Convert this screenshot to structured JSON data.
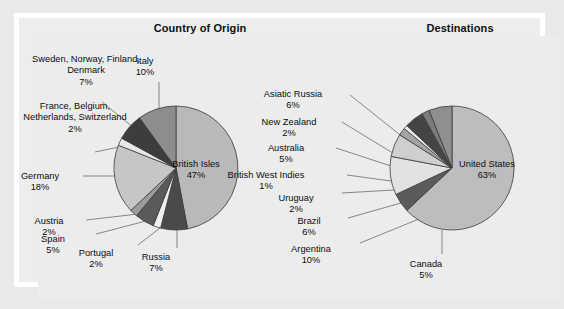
{
  "figure": {
    "background": "#ececec",
    "frame_color": "#ffffff",
    "outer_color": "#e9e9e9"
  },
  "charts": [
    {
      "id": "country-of-origin",
      "title": "Country of Origin",
      "type": "pie",
      "center": [
        176,
        168
      ],
      "radius": 62,
      "start_angle_deg": -90,
      "direction": "clockwise",
      "slices": [
        {
          "label": "British Isles",
          "value": 47,
          "pct_text": "47%",
          "color": "#b9b9b9",
          "label_mode": "inside",
          "label_x": 196,
          "label_y": 159
        },
        {
          "label": "Russia",
          "value": 7,
          "pct_text": "7%",
          "color": "#4a4a4a",
          "label_mode": "outside",
          "label_x": 156,
          "label_y": 252,
          "align": "center",
          "leader": [
            [
              177,
              230
            ],
            [
              177,
              248
            ]
          ]
        },
        {
          "label": "Portugal",
          "value": 2,
          "pct_text": "2%",
          "color": "#f0f0f0",
          "label_mode": "outside",
          "label_x": 96,
          "label_y": 248,
          "align": "center",
          "leader": [
            [
              160,
              228
            ],
            [
              138,
              245
            ]
          ]
        },
        {
          "label": "Spain",
          "value": 5,
          "pct_text": "5%",
          "color": "#5a5a5a",
          "label_mode": "outside",
          "label_x": 53,
          "label_y": 234,
          "align": "center",
          "leader": [
            [
              146,
              221
            ],
            [
              96,
              234
            ]
          ]
        },
        {
          "label": "Austria",
          "value": 2,
          "pct_text": "2%",
          "color": "#9c9c9c",
          "label_mode": "outside",
          "label_x": 49,
          "label_y": 216,
          "align": "center",
          "leader": [
            [
              138,
              214
            ],
            [
              86,
              220
            ]
          ]
        },
        {
          "label": "Germany",
          "value": 18,
          "pct_text": "18%",
          "color": "#c6c6c6",
          "label_mode": "outside",
          "label_x": 40,
          "label_y": 171,
          "align": "center",
          "leader": [
            [
              121,
              176
            ],
            [
              83,
              176
            ]
          ]
        },
        {
          "label": "France, Belgium, Netherlands, Switzerland",
          "value": 2,
          "pct_text": "2%",
          "color": "#e7e7e7",
          "label_mode": "outside",
          "label_x": 20,
          "label_y": 101,
          "align": "center",
          "leader": [
            [
              124,
              146
            ],
            [
              95,
              152
            ]
          ]
        },
        {
          "label": "Sweden, Norway, Finland, Denmark",
          "value": 7,
          "pct_text": "7%",
          "color": "#3d3d3d",
          "label_mode": "outside",
          "label_x": 31,
          "label_y": 54,
          "align": "center",
          "leader": [
            [
              134,
              128
            ],
            [
              102,
              102
            ]
          ]
        },
        {
          "label": "Italy",
          "value": 10,
          "pct_text": "10%",
          "color": "#8d8d8d",
          "label_mode": "outside",
          "label_x": 145,
          "label_y": 56,
          "align": "center",
          "leader": [
            [
              159,
              109
            ],
            [
              159,
              82
            ]
          ]
        }
      ]
    },
    {
      "id": "destinations",
      "title": "Destinations",
      "type": "pie",
      "center": [
        452,
        168
      ],
      "radius": 62,
      "start_angle_deg": -90,
      "direction": "clockwise",
      "slices": [
        {
          "label": "United States",
          "value": 63,
          "pct_text": "63%",
          "color": "#bdbdbd",
          "label_mode": "inside",
          "label_x": 487,
          "label_y": 159
        },
        {
          "label": "Canada",
          "value": 5,
          "pct_text": "5%",
          "color": "#5b5b5b",
          "label_mode": "outside",
          "label_x": 426,
          "label_y": 259,
          "align": "center",
          "leader": [
            [
              442,
              230
            ],
            [
              442,
              254
            ]
          ]
        },
        {
          "label": "Argentina",
          "value": 10,
          "pct_text": "10%",
          "color": "#e2e2e2",
          "label_mode": "outside",
          "label_x": 311,
          "label_y": 244,
          "align": "center",
          "leader": [
            [
              419,
              219
            ],
            [
              360,
              243
            ]
          ]
        },
        {
          "label": "Brazil",
          "value": 6,
          "pct_text": "6%",
          "color": "#cfcfcf",
          "label_mode": "outside",
          "label_x": 309,
          "label_y": 216,
          "align": "center",
          "leader": [
            [
              401,
              203
            ],
            [
              348,
              218
            ]
          ]
        },
        {
          "label": "Uruguay",
          "value": 2,
          "pct_text": "2%",
          "color": "#a5a5a5",
          "label_mode": "outside",
          "label_x": 296,
          "label_y": 193,
          "align": "center",
          "leader": [
            [
              394,
              190
            ],
            [
              342,
              193
            ]
          ]
        },
        {
          "label": "British West Indies",
          "value": 1,
          "pct_text": "1%",
          "color": "#efefef",
          "label_mode": "outside",
          "label_x": 266,
          "label_y": 170,
          "align": "center",
          "leader": [
            [
              391,
              181
            ],
            [
              347,
              175
            ]
          ]
        },
        {
          "label": "Australia",
          "value": 5,
          "pct_text": "5%",
          "color": "#454545",
          "label_mode": "outside",
          "label_x": 286,
          "label_y": 143,
          "align": "center",
          "leader": [
            [
              391,
              166
            ],
            [
              336,
              148
            ]
          ]
        },
        {
          "label": "New Zealand",
          "value": 2,
          "pct_text": "2%",
          "color": "#7b7b7b",
          "label_mode": "outside",
          "label_x": 289,
          "label_y": 117,
          "align": "center",
          "leader": [
            [
              396,
              155
            ],
            [
              342,
              122
            ]
          ]
        },
        {
          "label": "Asiatic Russia",
          "value": 6,
          "pct_text": "6%",
          "color": "#8f8f8f",
          "label_mode": "outside",
          "label_x": 293,
          "label_y": 89,
          "align": "center",
          "leader": [
            [
              404,
              138
            ],
            [
              350,
              95
            ]
          ]
        }
      ]
    }
  ],
  "style": {
    "slice_outline": "#3a3a3a",
    "leader_color": "#6b6b6b",
    "text_color": "#0d0d0d",
    "title_color": "#111111"
  }
}
